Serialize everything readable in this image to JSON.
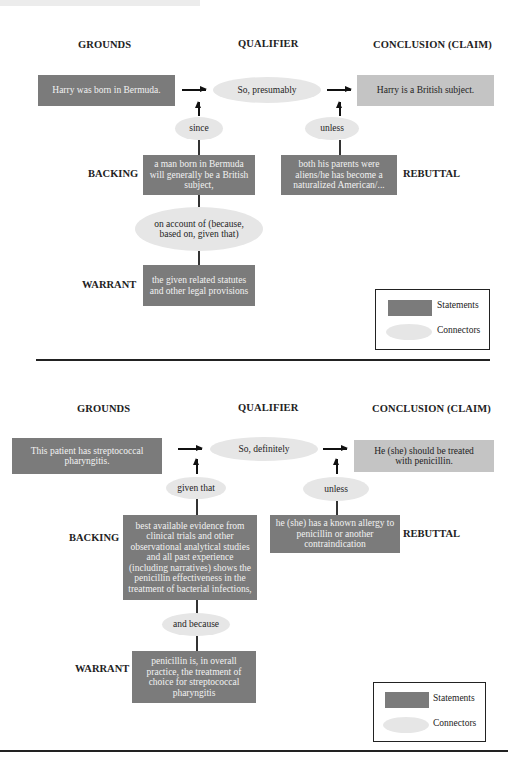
{
  "diagrams": [
    {
      "headers": {
        "grounds": "GROUNDS",
        "qualifier": "QUALIFIER",
        "conclusion": "CONCLUSION (CLAIM)"
      },
      "grounds": "Harry was born in Bermuda.",
      "qualifier": "So, presumably",
      "conclusion": "Harry is a British subject.",
      "backing_connector": "since",
      "backing_label": "BACKING",
      "backing": "a man born in Bermuda will generally be a British subject,",
      "warrant_connector": "on account of (because, based on, given that)",
      "warrant_label": "WARRANT",
      "warrant": "the given related statutes and other legal provisions",
      "rebuttal_connector": "unless",
      "rebuttal_label": "REBUTTAL",
      "rebuttal": "both his parents were aliens/he has become a naturalized American/...",
      "legend": {
        "statements": "Statements",
        "connectors": "Connectors"
      }
    },
    {
      "headers": {
        "grounds": "GROUNDS",
        "qualifier": "QUALIFIER",
        "conclusion": "CONCLUSION (CLAIM)"
      },
      "grounds": "This patient has streptococcal pharyngitis.",
      "qualifier": "So, definitely",
      "conclusion": "He (she) should be treated with penicillin.",
      "backing_connector": "given that",
      "backing_label": "BACKING",
      "backing": "best available evidence from clinical trials and other observational analytical studies and all past experience (including narratives) shows the penicillin effectiveness in the treatment of bacterial infections,",
      "warrant_connector": "and because",
      "warrant_label": "WARRANT",
      "warrant": "penicillin is, in overall practice, the treatment of choice for streptococcal pharyngitis",
      "rebuttal_connector": "unless",
      "rebuttal_label": "REBUTTAL",
      "rebuttal": "he (she) has a known allergy to penicillin or another contraindication",
      "legend": {
        "statements": "Statements",
        "connectors": "Connectors"
      }
    }
  ],
  "colors": {
    "statement_dark": "#7b7b7b",
    "statement_light": "#c4c4c4",
    "connector": "#e6e6e6",
    "line": "#222222"
  }
}
